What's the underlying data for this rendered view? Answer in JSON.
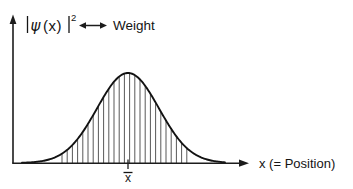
{
  "figure": {
    "title_present": false,
    "background_color": "#ffffff",
    "ink_color": "#141414"
  },
  "y_axis": {
    "label_parts": {
      "open_bar": "|",
      "psi": "ψ",
      "arg_open": "(",
      "arg": "x",
      "arg_close": ")",
      "close_bar": "|",
      "exponent": "2"
    },
    "label_plain": "|ψ(x)|²",
    "axis_start": {
      "x": 13,
      "y": 163
    },
    "axis_end": {
      "x": 13,
      "y": 18
    },
    "has_arrowhead": true
  },
  "x_axis": {
    "label": "x (= Position)",
    "label_symbol": "x",
    "label_suffix": "(= Position)",
    "axis_start": {
      "x": 13,
      "y": 163
    },
    "axis_end": {
      "x": 248,
      "y": 163
    },
    "has_arrowhead": true
  },
  "annotation": {
    "arrow_glyph": "↔",
    "arrow_type": "double-headed",
    "label": "Weight",
    "connects": [
      "|ψ(x)|²",
      "Weight"
    ]
  },
  "mean_marker": {
    "label": "x̄",
    "label_symbol": "x",
    "has_overbar": true,
    "x_position": 128
  },
  "chart_data": {
    "type": "line",
    "title": "",
    "xlabel": "x (= Position)",
    "ylabel": "|ψ(x)|²",
    "grid": false,
    "legend": false,
    "curve_name": "Gaussian probability density",
    "mean": 128,
    "sigma": 31,
    "peak_value": 90,
    "baseline_y": 163,
    "peak_y": 73,
    "xlim": [
      13,
      248
    ],
    "x": [
      30,
      40,
      50,
      60,
      70,
      80,
      90,
      100,
      110,
      120,
      128,
      136,
      146,
      156,
      166,
      176,
      186,
      196,
      206,
      216
    ],
    "values": [
      0.4,
      1.0,
      2.3,
      5.0,
      10.0,
      18.3,
      30.6,
      46.9,
      66.0,
      84.3,
      90.0,
      84.3,
      68.4,
      50.0,
      33.2,
      20.1,
      11.1,
      5.5,
      2.5,
      1.0
    ],
    "hatch": {
      "present": true,
      "orientation": "vertical",
      "x_start": 62,
      "x_end": 190,
      "spacing": 5.2,
      "count": 25,
      "color": "#3a3a3a"
    }
  }
}
